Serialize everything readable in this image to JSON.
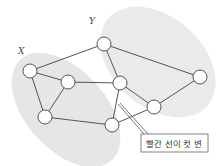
{
  "diagram": {
    "type": "graph-cut",
    "sets": [
      {
        "id": "X",
        "label": "X",
        "fill": "#e6e6e6",
        "cx": 66,
        "cy": 110,
        "rx": 40,
        "ry": 68,
        "rotate": -42,
        "label_x": 18,
        "label_y": 54
      },
      {
        "id": "Y",
        "label": "Y",
        "fill": "#eaeaea",
        "cx": 158,
        "cy": 62,
        "rx": 45,
        "ry": 66,
        "rotate": -48,
        "label_x": 89,
        "label_y": 24
      }
    ],
    "nodes": [
      {
        "id": "a",
        "x": 30,
        "y": 71,
        "set": "X"
      },
      {
        "id": "b",
        "x": 68,
        "y": 82,
        "set": "X"
      },
      {
        "id": "c",
        "x": 45,
        "y": 117,
        "set": "X"
      },
      {
        "id": "d",
        "x": 104,
        "y": 44,
        "set": "Y"
      },
      {
        "id": "e",
        "x": 120,
        "y": 83,
        "set": "Y"
      },
      {
        "id": "f",
        "x": 200,
        "y": 77,
        "set": "Y"
      },
      {
        "id": "g",
        "x": 154,
        "y": 107,
        "set": "Y"
      },
      {
        "id": "h",
        "x": 112,
        "y": 125,
        "set": "X"
      }
    ],
    "edges": [
      [
        "a",
        "d"
      ],
      [
        "a",
        "b"
      ],
      [
        "a",
        "c"
      ],
      [
        "b",
        "c"
      ],
      [
        "b",
        "e"
      ],
      [
        "c",
        "h"
      ],
      [
        "d",
        "e"
      ],
      [
        "d",
        "f"
      ],
      [
        "e",
        "g"
      ],
      [
        "e",
        "h"
      ],
      [
        "g",
        "f"
      ],
      [
        "h",
        "g"
      ]
    ],
    "node_radius": 7,
    "edge_color": "#555555",
    "node_stroke": "#555555",
    "callout": {
      "text": "빨간 선이 컷 변",
      "box": {
        "x": 141,
        "y": 134,
        "w": 67,
        "h": 18
      },
      "pointer": {
        "x1": 118,
        "y1": 104,
        "x2": 144,
        "y2": 134
      }
    }
  }
}
